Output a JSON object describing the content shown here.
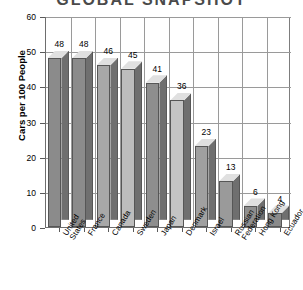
{
  "chart_data": {
    "type": "bar",
    "title": "GLOBAL SNAPSHOT",
    "xlabel": "",
    "ylabel": "Cars per 100 People",
    "categories": [
      "United States",
      "France",
      "Canada",
      "Sweden",
      "Japan",
      "Denmark",
      "Israel",
      "Russian Federation",
      "Hong Kong",
      "Ecuador"
    ],
    "values": [
      48,
      48,
      46,
      45,
      41,
      36,
      23,
      13,
      6,
      4
    ],
    "value_labels": [
      "48",
      "48",
      "46",
      "45",
      "41",
      "36",
      "23",
      "13",
      "6",
      "4"
    ],
    "ylim": [
      0,
      60
    ],
    "yticks": [
      0,
      10,
      20,
      30,
      40,
      50,
      60
    ],
    "ytick_labels": [
      "0",
      "10",
      "20",
      "30",
      "40",
      "50",
      "60"
    ],
    "grid": true,
    "grid_axis": "both",
    "legend": false,
    "style": "3d-bars",
    "bar_colors": [
      "#8b8b8b",
      "#8b8b8b",
      "#a8a8a8",
      "#bdbdbd",
      "#8e8e8e",
      "#c4c4c4",
      "#a0a0a0",
      "#9a9a9a",
      "#8f8f8f",
      "#8a8a8a"
    ]
  },
  "colors": {
    "background": "#ffffff",
    "axis": "#6e6e6e",
    "grid": "#9a9a9a",
    "title": "#4a4a4a",
    "text": "#000000",
    "bar_top": "#e0e0e0",
    "bar_side": "#6f6f6f",
    "bar_outline": "#565656"
  }
}
